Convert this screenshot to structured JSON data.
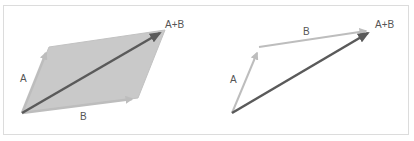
{
  "diagrams": [
    {
      "name": "parallelogram-rule",
      "labels": {
        "a": "A",
        "b": "B",
        "sum": "A+B"
      },
      "vectors": [
        "A",
        "B",
        "A+B"
      ]
    },
    {
      "name": "triangle-rule",
      "labels": {
        "a": "A",
        "b": "B",
        "sum": "A+B"
      },
      "vectors": [
        "A",
        "B",
        "A+B"
      ]
    }
  ],
  "colors": {
    "component_vector": "#bdbdbd",
    "resultant_vector": "#5a5a5a",
    "parallelogram_fill": "#c9c9c9",
    "frame_border": "#dcdcdc",
    "label_text": "#555555"
  }
}
